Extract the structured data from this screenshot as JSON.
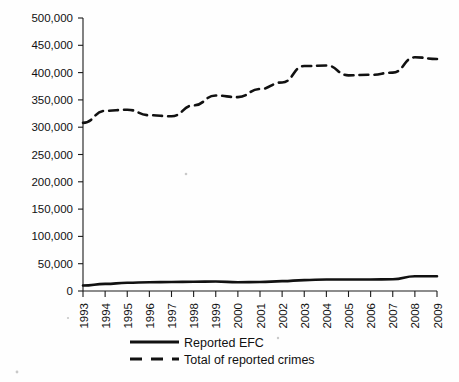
{
  "figure": {
    "background_color": "#fefefe",
    "ink_color": "#111111"
  },
  "legend": {
    "position": "below-axis-center",
    "entries": [
      {
        "label": "Reported EFC",
        "style": "solid",
        "color": "#111111"
      },
      {
        "label": "Total of reported crimes",
        "style": "dashed",
        "color": "#111111"
      }
    ]
  },
  "chart_data": {
    "type": "line",
    "title": "",
    "subtitle": "",
    "xlabel": "",
    "ylabel": "",
    "grid": false,
    "legend_position": "bottom",
    "categories": [
      "1993",
      "1994",
      "1995",
      "1996",
      "1997",
      "1998",
      "1999",
      "2000",
      "2001",
      "2002",
      "2003",
      "2004",
      "2005",
      "2006",
      "2007",
      "2008",
      "2009"
    ],
    "x_tick_labels": [
      "1993",
      "1994",
      "1995",
      "1996",
      "1997",
      "1998",
      "1999",
      "2000",
      "2001",
      "2002",
      "2003",
      "2004",
      "2005",
      "2006",
      "2007",
      "2008",
      "2009"
    ],
    "x_tick_rotation_degrees": 90,
    "y_tick_labels": [
      "0",
      "50,000",
      "100,000",
      "150,000",
      "200,000",
      "250,000",
      "300,000",
      "350,000",
      "400,000",
      "450,000",
      "500,000"
    ],
    "y_tick_values": [
      0,
      50000,
      100000,
      150000,
      200000,
      250000,
      300000,
      350000,
      400000,
      450000,
      500000
    ],
    "ylim": [
      0,
      500000
    ],
    "y_tick_interval": 50000,
    "series": [
      {
        "name": "Reported EFC",
        "style": "solid",
        "color": "#111111",
        "values": [
          10000,
          13000,
          15000,
          16000,
          16500,
          17000,
          17500,
          16000,
          16500,
          18000,
          20000,
          21000,
          21000,
          21000,
          21500,
          27000,
          27000
        ]
      },
      {
        "name": "Total of reported crimes",
        "style": "dashed",
        "color": "#111111",
        "values": [
          308000,
          330000,
          332000,
          322000,
          320000,
          340000,
          358000,
          355000,
          370000,
          382000,
          412000,
          413000,
          395000,
          396000,
          400000,
          428000,
          425000
        ]
      }
    ]
  }
}
